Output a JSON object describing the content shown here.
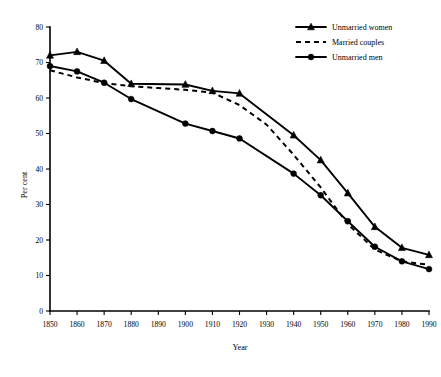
{
  "chart_data": {
    "type": "line",
    "title": "",
    "xlabel": "Year",
    "ylabel": "Per cent",
    "xlim": [
      1850,
      1990
    ],
    "ylim": [
      0,
      80
    ],
    "xticks": [
      1850,
      1860,
      1870,
      1880,
      1890,
      1900,
      1910,
      1920,
      1930,
      1940,
      1950,
      1960,
      1970,
      1980,
      1990
    ],
    "yticks": [
      0,
      10,
      20,
      30,
      40,
      50,
      60,
      70,
      80
    ],
    "grid": false,
    "legend_position": "top-right",
    "x": [
      1850,
      1860,
      1870,
      1880,
      1890,
      1900,
      1910,
      1920,
      1930,
      1940,
      1950,
      1960,
      1970,
      1980,
      1990
    ],
    "series": [
      {
        "name": "Unmarried women",
        "style": "solid",
        "marker": "triangle",
        "x": [
          1850,
          1860,
          1870,
          1880,
          1900,
          1910,
          1920,
          1940,
          1950,
          1960,
          1970,
          1980,
          1990
        ],
        "values": [
          72.0,
          73.0,
          70.5,
          64.0,
          63.8,
          62.0,
          61.3,
          49.5,
          42.5,
          33.2,
          23.7,
          17.8,
          15.8
        ]
      },
      {
        "name": "Married couples",
        "style": "dashed",
        "marker": "none",
        "x": [
          1850,
          1860,
          1870,
          1880,
          1890,
          1900,
          1910,
          1920,
          1930,
          1940,
          1950,
          1960,
          1970,
          1980,
          1990
        ],
        "values": [
          67.8,
          65.8,
          64.2,
          63.3,
          62.8,
          62.3,
          61.5,
          58.0,
          52.5,
          44.0,
          34.8,
          24.5,
          17.3,
          14.0,
          13.0
        ]
      },
      {
        "name": "Unmarried men",
        "style": "solid",
        "marker": "circle",
        "x": [
          1850,
          1860,
          1870,
          1880,
          1900,
          1910,
          1920,
          1940,
          1950,
          1960,
          1970,
          1980,
          1990
        ],
        "values": [
          69.0,
          67.5,
          64.3,
          59.7,
          52.8,
          50.7,
          48.6,
          38.7,
          32.6,
          25.3,
          18.1,
          14.0,
          11.8
        ]
      }
    ]
  },
  "axes": {
    "xlabel": "Year",
    "ylabel": "Per cent",
    "xticklabels": [
      "1850",
      "1860",
      "1870",
      "1880",
      "1890",
      "1900",
      "1910",
      "1920",
      "1930",
      "1940",
      "1950",
      "1960",
      "1970",
      "1980",
      "1990"
    ],
    "yticklabels": [
      "0",
      "10",
      "20",
      "30",
      "40",
      "50",
      "60",
      "70",
      "80"
    ]
  },
  "legend": {
    "items": [
      {
        "label": "Unmarried women",
        "style": "solid",
        "marker": "triangle"
      },
      {
        "label": "Married couples",
        "style": "dashed",
        "marker": "none"
      },
      {
        "label": "Unmarried men",
        "style": "solid",
        "marker": "circle"
      }
    ]
  },
  "colors": {
    "ink": "#000000",
    "background": "#ffffff"
  }
}
